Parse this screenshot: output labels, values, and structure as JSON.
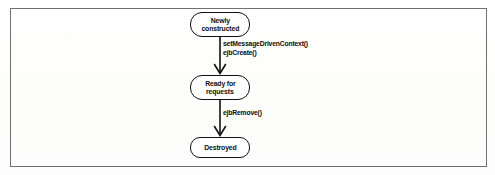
{
  "figure": {
    "width": 495,
    "height": 175,
    "frame_color": "#6e7072",
    "line_color": "#111111",
    "background_color": "#fdfdfd"
  },
  "diagram": {
    "type": "state-diagram",
    "orientation": "vertical",
    "states": [
      {
        "id": "newly-constructed",
        "lines": [
          "Newly",
          "constructed"
        ],
        "line1": "Newly",
        "line2": "constructed",
        "x": 190,
        "y": 12,
        "width": 60,
        "height": 25,
        "radius": 12
      },
      {
        "id": "ready-for-requests",
        "lines": [
          "Ready for",
          "requests"
        ],
        "line1": "Ready for",
        "line2": "requests",
        "x": 190,
        "y": 75,
        "width": 60,
        "height": 25,
        "radius": 12
      },
      {
        "id": "destroyed",
        "lines": [
          "Destroyed"
        ],
        "line1": "Destroyed",
        "line2": "",
        "x": 190,
        "y": 137,
        "width": 60,
        "height": 21,
        "radius": 10
      }
    ],
    "transitions": [
      {
        "id": "construct-to-ready",
        "from": "newly-constructed",
        "to": "ready-for-requests",
        "labels": [
          "setMessageDrivenContext()",
          "ejbCreate()"
        ],
        "label1": "setMessageDrivenContext()",
        "label2": "ejbCreate()",
        "x": 220,
        "y1": 37,
        "y2": 75,
        "label_x": 223,
        "label_y": 40
      },
      {
        "id": "ready-to-destroyed",
        "from": "ready-for-requests",
        "to": "destroyed",
        "labels": [
          "ejbRemove()"
        ],
        "label1": "ejbRemove()",
        "label2": "",
        "x": 220,
        "y1": 100,
        "y2": 137,
        "label_x": 223,
        "label_y": 109
      }
    ]
  }
}
